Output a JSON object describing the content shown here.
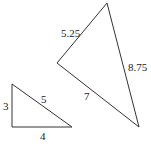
{
  "diagram": {
    "small_triangle": {
      "vertices": [
        [
          12,
          84
        ],
        [
          12,
          127
        ],
        [
          72,
          127
        ]
      ],
      "labels": [
        {
          "text": "3",
          "x": 3,
          "y": 110
        },
        {
          "text": "5",
          "x": 41,
          "y": 103
        },
        {
          "text": "4",
          "x": 40,
          "y": 140
        }
      ]
    },
    "large_triangle": {
      "vertices": [
        [
          107,
          3
        ],
        [
          57,
          63
        ],
        [
          139,
          127
        ]
      ],
      "labels": [
        {
          "text": "5.25",
          "x": 61,
          "y": 37
        },
        {
          "text": "7",
          "x": 84,
          "y": 100
        },
        {
          "text": "8.75",
          "x": 128,
          "y": 71
        }
      ]
    },
    "stroke_color": "#333333"
  }
}
